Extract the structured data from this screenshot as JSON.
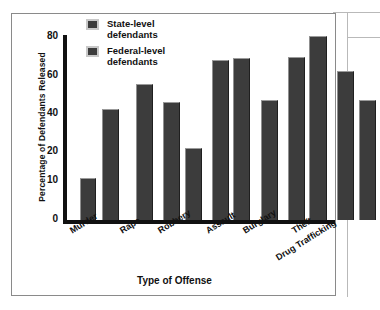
{
  "chart_data": {
    "type": "bar",
    "title": "",
    "xlabel": "Type of Offense",
    "ylabel": "Percentage of Defendants Released",
    "categories": [
      "Murder",
      "Rape",
      "Robbery",
      "Assault",
      "Burglary",
      "Theft",
      "Drug Trafficking"
    ],
    "series": [
      {
        "name": "State-level defendants",
        "values": [
          13,
          null,
          42,
          67,
          null,
          69,
          62
        ]
      },
      {
        "name": "Federal-level defendants",
        "values": [
          41,
          57,
          21,
          69,
          50,
          80,
          49
        ]
      }
    ],
    "ytick_labels": [
      "0",
      "10",
      "20",
      "40",
      "60",
      "80"
    ],
    "ytick_values": [
      0,
      10,
      20,
      40,
      60,
      80
    ],
    "ylim": [
      0,
      80
    ],
    "grid": false,
    "legend_position": "top-left",
    "bar_color": "#3c3c3c"
  },
  "axes": {
    "y_title": "Percentage of Defendants Released",
    "x_title": "Type of Offense",
    "y_ticks": [
      {
        "label": "80",
        "top": 17
      },
      {
        "label": "60",
        "top": 56
      },
      {
        "label": "40",
        "top": 94
      },
      {
        "label": "20",
        "top": 132
      },
      {
        "label": "10",
        "top": 161
      },
      {
        "label": "0",
        "top": 200
      }
    ]
  },
  "legend": {
    "items": [
      {
        "label_line1": "State-level",
        "label_line2": "defendants"
      },
      {
        "label_line1": "Federal-level",
        "label_line2": "defendants"
      }
    ]
  },
  "categories": [
    {
      "label": "Murder",
      "left": 56,
      "top": 213
    },
    {
      "label": "Rape",
      "left": 106,
      "top": 213
    },
    {
      "label": "Robbery",
      "left": 144,
      "top": 213
    },
    {
      "label": "Assault",
      "left": 192,
      "top": 213
    },
    {
      "label": "Burglary",
      "left": 229,
      "top": 213
    },
    {
      "label": "Theft",
      "left": 278,
      "top": 213
    },
    {
      "label": "Drug Trafficking",
      "left": 262,
      "top": 240
    }
  ],
  "bars": [
    {
      "name": "bar-murder-state",
      "left": 68,
      "top": 164,
      "width": 16,
      "height": 42
    },
    {
      "name": "bar-murder-federal",
      "left": 90,
      "top": 95,
      "width": 17,
      "height": 111
    },
    {
      "name": "bar-rape-federal",
      "left": 124,
      "top": 70,
      "width": 17,
      "height": 136
    },
    {
      "name": "bar-robbery-state",
      "left": 151,
      "top": 88,
      "width": 17,
      "height": 118
    },
    {
      "name": "bar-robbery-federal",
      "left": 173,
      "top": 134,
      "width": 17,
      "height": 72
    },
    {
      "name": "bar-assault-state",
      "left": 200,
      "top": 46,
      "width": 17,
      "height": 160
    },
    {
      "name": "bar-assault-federal",
      "left": 221,
      "top": 44,
      "width": 17,
      "height": 162
    },
    {
      "name": "bar-burglary-federal",
      "left": 249,
      "top": 86,
      "width": 17,
      "height": 120
    },
    {
      "name": "bar-theft-state",
      "left": 276,
      "top": 43,
      "width": 17,
      "height": 163
    },
    {
      "name": "bar-theft-federal",
      "left": 297,
      "top": 22,
      "width": 18,
      "height": 184
    },
    {
      "name": "bar-drugtrafficking-state",
      "left": 325,
      "top": 57,
      "width": 17,
      "height": 149
    },
    {
      "name": "bar-drugtrafficking-federal",
      "left": 347,
      "top": 86,
      "width": 17,
      "height": 120
    }
  ]
}
